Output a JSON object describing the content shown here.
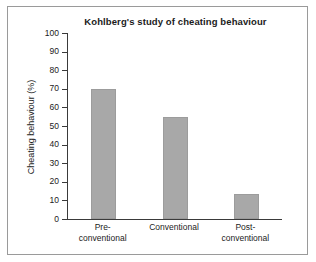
{
  "chart_data": {
    "type": "bar",
    "title": "Kohlberg's study of cheating behaviour",
    "xlabel": "",
    "ylabel": "Cheating behaviour (%)",
    "categories": [
      "Pre-conventional",
      "Conventional",
      "Post-conventional"
    ],
    "category_lines": [
      [
        "Pre-",
        "conventional"
      ],
      [
        "Conventional"
      ],
      [
        "Post-",
        "conventional"
      ]
    ],
    "values": [
      70,
      55,
      13.5
    ],
    "ylim": [
      0,
      100
    ],
    "yticks": [
      0,
      10,
      20,
      30,
      40,
      50,
      60,
      70,
      80,
      90,
      100
    ],
    "ytick_labels": [
      "0",
      "10",
      "20",
      "30",
      "40",
      "50",
      "60",
      "70",
      "80",
      "90",
      "100"
    ],
    "grid": false,
    "legend": false,
    "bar_color": "#a8a8a8",
    "axis_color": "#3a3a3a",
    "background_color": "#ffffff",
    "frame_color": "#9a9a9a"
  }
}
